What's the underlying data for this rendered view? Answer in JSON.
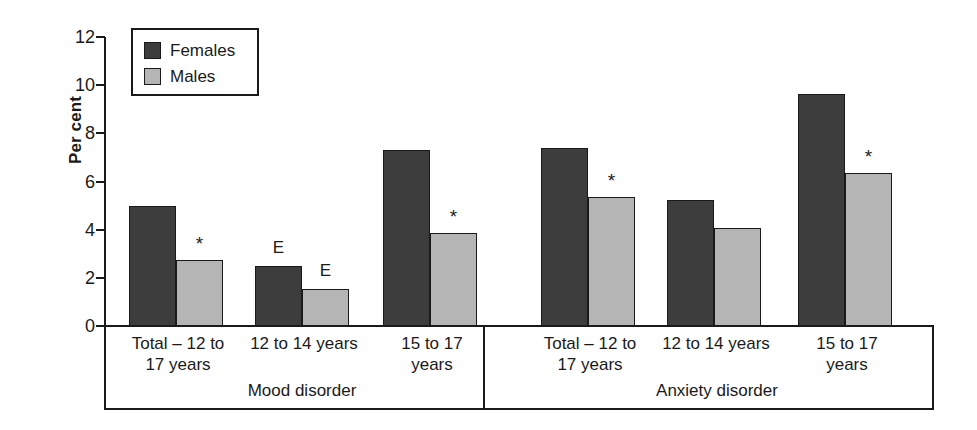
{
  "chart_data": {
    "type": "bar",
    "title": "",
    "xlabel": "",
    "ylabel": "Per cent",
    "ylim": [
      0,
      12
    ],
    "yticks": [
      0,
      2,
      4,
      6,
      8,
      10,
      12
    ],
    "grid": false,
    "legend_position": "top-left",
    "categories": [
      "Total – 12 to 17 years",
      "12 to 14 years",
      "15 to 17 years",
      "Total – 12 to 17 years",
      "12 to 14 years",
      "15 to 17 years"
    ],
    "sections": [
      {
        "name": "Mood disorder",
        "categories": [
          0,
          1,
          2
        ]
      },
      {
        "name": "Anxiety disorder",
        "categories": [
          3,
          4,
          5
        ]
      }
    ],
    "series": [
      {
        "name": "Females",
        "color": "#3d3d3d",
        "values": [
          5.0,
          2.5,
          7.3,
          7.4,
          5.25,
          9.65
        ],
        "markers": [
          "",
          "E",
          "",
          "",
          "",
          ""
        ]
      },
      {
        "name": "Males",
        "color": "#b5b5b5",
        "values": [
          2.75,
          1.55,
          3.85,
          5.35,
          4.05,
          6.35
        ],
        "markers": [
          "*",
          "E",
          "*",
          "*",
          "",
          "*"
        ]
      }
    ]
  },
  "axis": {
    "y_title": "Per cent",
    "tick_labels": [
      "12",
      "10",
      "8",
      "6",
      "4",
      "2",
      "0"
    ]
  },
  "legend": {
    "items": [
      {
        "label": "Females",
        "swatch": "females"
      },
      {
        "label": "Males",
        "swatch": "males"
      }
    ]
  },
  "category_labels": [
    {
      "line1": "Total – 12 to",
      "line2": "17 years"
    },
    {
      "line1": "12 to 14 years",
      "line2": ""
    },
    {
      "line1": "15 to 17",
      "line2": "years"
    },
    {
      "line1": "Total – 12 to",
      "line2": "17 years"
    },
    {
      "line1": "12 to 14 years",
      "line2": ""
    },
    {
      "line1": "15 to 17",
      "line2": "years"
    }
  ],
  "section_labels": [
    "Mood disorder",
    "Anxiety disorder"
  ]
}
